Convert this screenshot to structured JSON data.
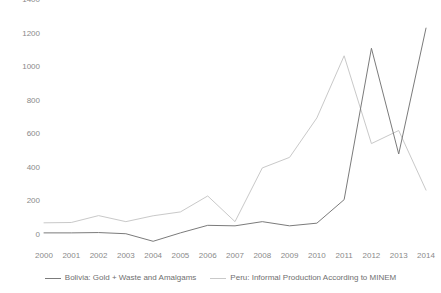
{
  "chart_data": {
    "type": "line",
    "title": "",
    "subtitle": "",
    "xlabel": "",
    "ylabel": "",
    "categories": [
      "2000",
      "2001",
      "2002",
      "2003",
      "2004",
      "2005",
      "2006",
      "2007",
      "2008",
      "2009",
      "2010",
      "2011",
      "2012",
      "2013",
      "2014"
    ],
    "x": [
      2000,
      2001,
      2002,
      2003,
      2004,
      2005,
      2006,
      2007,
      2008,
      2009,
      2010,
      2011,
      2012,
      2013,
      2014
    ],
    "ylim": [
      0,
      1400
    ],
    "xlim": [
      2000,
      2014
    ],
    "yticks": [
      0,
      200,
      400,
      600,
      800,
      1000,
      1200,
      1400
    ],
    "ytick_labels": [
      "0",
      "200",
      "400",
      "600",
      "800",
      "1000",
      "1200",
      "1400"
    ],
    "grid": false,
    "legend_position": "bottom-center",
    "series": [
      {
        "name": "Bolivia: Gold + Waste and Amalgams",
        "color": "#7b7b7b",
        "values": [
          90,
          90,
          92,
          85,
          40,
          90,
          135,
          132,
          157,
          132,
          148,
          288,
          1190,
          560,
          1310
        ]
      },
      {
        "name": "Peru: Informal Production According to MINEM",
        "color": "#c9c9c9",
        "values": [
          150,
          152,
          193,
          157,
          192,
          215,
          310,
          157,
          477,
          540,
          775,
          1145,
          622,
          700,
          345
        ]
      }
    ]
  },
  "legend": {
    "entries": [
      {
        "label": "Bolivia: Gold + Waste and Amalgams",
        "color": "#7b7b7b"
      },
      {
        "label": "Peru: Informal Production According to MINEM",
        "color": "#c9c9c9"
      }
    ]
  },
  "colors": {
    "background": "#ffffff",
    "axis_text": "#8a8a8a",
    "legend_text": "#6f6f6f",
    "series_bolivia": "#7b7b7b",
    "series_peru": "#c9c9c9"
  }
}
